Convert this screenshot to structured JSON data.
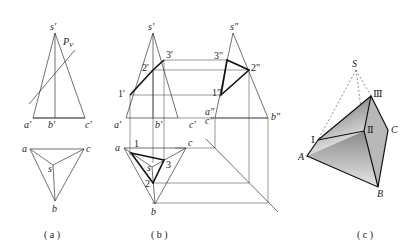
{
  "header": {
    "text": ""
  },
  "panels": [
    {
      "caption": "( a )",
      "front_view": {
        "labels": {
          "apex": "s'",
          "plane": "PV",
          "plane_main": "P",
          "plane_sub": "V",
          "a": "a'",
          "b": "b'",
          "c": "c'"
        }
      },
      "top_view": {
        "labels": {
          "a": "a",
          "b": "b",
          "c": "c",
          "s": "s"
        }
      }
    },
    {
      "caption": "( b )",
      "front_view": {
        "labels": {
          "apex": "s'",
          "a": "a'",
          "b": "b'",
          "c": "c'",
          "p1": "1'",
          "p2": "2'",
          "p3": "3'"
        }
      },
      "side_view": {
        "labels": {
          "apex": "s\"",
          "a": "a\"",
          "c": "c\"",
          "b": "b\"",
          "p1": "1\"",
          "p2": "2\"",
          "p3": "3\""
        }
      },
      "top_view": {
        "labels": {
          "a": "a",
          "b": "b",
          "c": "c",
          "s": "s",
          "p1": "1",
          "p2": "2",
          "p3": "3"
        }
      }
    },
    {
      "caption": "( c )",
      "solid": {
        "labels": {
          "S": "S",
          "A": "A",
          "B": "B",
          "C": "C",
          "I": "Ⅰ",
          "II": "Ⅱ",
          "III": "Ⅲ"
        },
        "shade_dark": "#6e6e6e",
        "shade_light": "#f2f2f2"
      }
    }
  ]
}
